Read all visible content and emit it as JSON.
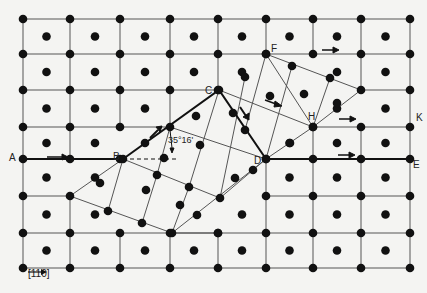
{
  "labels": {
    "A": "A",
    "B": "B",
    "C": "C",
    "D": "D",
    "E": "E",
    "F": "F",
    "H": "H",
    "K": "K"
  },
  "angle_label": "35°16'",
  "legend": {
    "arrow": "→",
    "direction": "[110]"
  },
  "colors": {
    "background": "#f4f4f2",
    "ink": "#111111",
    "line": "#555555"
  },
  "matrix": {
    "cols_x": [
      23,
      70,
      120,
      170,
      218,
      266,
      313,
      361,
      410
    ],
    "rows_y": [
      19,
      54,
      90,
      127,
      159,
      196,
      233,
      268
    ]
  },
  "twin_boundary_upper": [
    [
      123,
      159
    ],
    [
      170,
      127
    ],
    [
      219,
      90
    ],
    [
      266,
      54
    ]
  ],
  "twin_boundary_lower": [
    [
      70,
      196
    ],
    [
      218,
      233
    ],
    [
      266,
      159
    ],
    [
      361,
      90
    ]
  ]
}
